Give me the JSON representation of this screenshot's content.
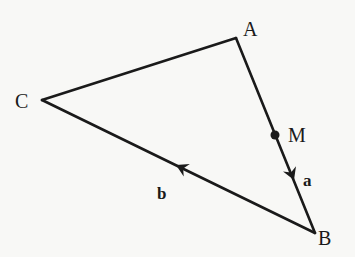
{
  "diagram": {
    "type": "vector-triangle",
    "colors": {
      "stroke": "#1a1a1a",
      "background": "#f8f8f6"
    },
    "points": {
      "A": {
        "label": "A",
        "x": 236,
        "y": 38
      },
      "B": {
        "label": "B",
        "x": 315,
        "y": 233
      },
      "C": {
        "label": "C",
        "x": 42,
        "y": 100
      },
      "M": {
        "label": "M",
        "x": 275,
        "y": 135
      }
    },
    "segments": [
      {
        "from": "C",
        "to": "A"
      },
      {
        "from": "A",
        "to": "B",
        "vector_label": "a",
        "direction": "A->B"
      },
      {
        "from": "B",
        "to": "C",
        "vector_label": "b",
        "direction": "B->C"
      }
    ],
    "vectors": {
      "a": {
        "label": "a",
        "on_segment": "AB"
      },
      "b": {
        "label": "b",
        "on_segment": "BC"
      }
    }
  }
}
